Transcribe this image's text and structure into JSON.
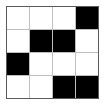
{
  "widget": {
    "kind": "binary-grid",
    "rows": 4,
    "columns": 4,
    "border_color": "#5a5a5a",
    "gridline_color": "#bfbfbf",
    "filled_color": "#000000",
    "empty_color": "#ffffff",
    "background_color": "#ffffff"
  },
  "chart_data": {
    "type": "heatmap",
    "title": "",
    "xlabel": "",
    "ylabel": "",
    "categories": [
      "C1",
      "C2",
      "C3",
      "C4"
    ],
    "row_labels": [
      "R1",
      "R2",
      "R3",
      "R4"
    ],
    "grid": true,
    "legend": "none",
    "value_map": {
      "0": "empty",
      "1": "filled"
    },
    "values": [
      [
        0,
        0,
        0,
        1
      ],
      [
        0,
        1,
        1,
        0
      ],
      [
        1,
        0,
        0,
        0
      ],
      [
        0,
        0,
        1,
        1
      ]
    ]
  }
}
